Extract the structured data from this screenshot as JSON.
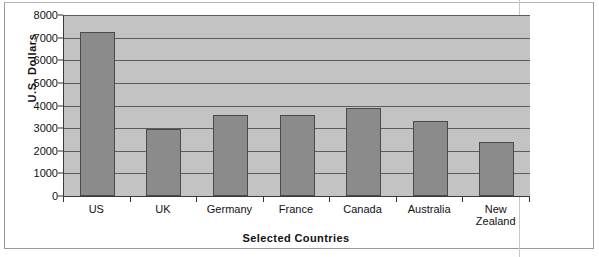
{
  "chart_data": {
    "type": "bar",
    "title": "",
    "xlabel": "Selected Countries",
    "ylabel": "U.S. Dollars",
    "categories": [
      "US",
      "UK",
      "Germany",
      "France",
      "Canada",
      "Australia",
      "New Zealand"
    ],
    "values": [
      7250,
      2950,
      3570,
      3570,
      3900,
      3300,
      2400
    ],
    "ylim": [
      0,
      8000
    ],
    "ytick_labels": [
      "0",
      "1000",
      "2000",
      "3000",
      "4000",
      "5000",
      "6000",
      "7000",
      "8000"
    ],
    "ytick_values": [
      0,
      1000,
      2000,
      3000,
      4000,
      5000,
      6000,
      7000,
      8000
    ],
    "grid": true,
    "legend": "none",
    "colors": {
      "bar_fill": "#8b8b8b",
      "bar_border": "#4a4a4a",
      "plot_background": "#c3c3c3",
      "gridline": "#5d5d5d",
      "axis": "#3a3a3a",
      "text": "#111111"
    }
  }
}
